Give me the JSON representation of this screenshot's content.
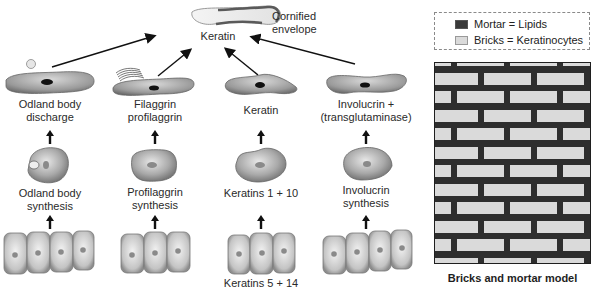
{
  "top": {
    "envelope_label_line1": "Cornified",
    "envelope_label_line2": "envelope",
    "keratin_label": "Keratin"
  },
  "columns": [
    {
      "stage3": [
        "Odland body",
        "discharge"
      ],
      "stage2": [
        "Odland body",
        "synthesis"
      ],
      "stage1": []
    },
    {
      "stage3": [
        "Filaggrin",
        "profilaggrin"
      ],
      "stage2": [
        "Profilaggrin",
        "synthesis"
      ],
      "stage1": []
    },
    {
      "stage3": [
        "Keratin"
      ],
      "stage2": [
        "Keratins 1 + 10"
      ],
      "stage1": [
        "Keratins 5 + 14"
      ]
    },
    {
      "stage3": [
        "Involucrin +",
        "(transglutaminase)"
      ],
      "stage2": [
        "Involucrin",
        "synthesis"
      ],
      "stage1": []
    }
  ],
  "legend": {
    "items": [
      {
        "label": "Mortar = Lipids",
        "color": "#3a3a3a"
      },
      {
        "label": "Bricks = Keratinocytes",
        "color": "#dadada"
      }
    ]
  },
  "model": {
    "caption": "Bricks and mortar model",
    "mortar_color": "#2e2e2e",
    "brick_color": "#dadada",
    "rows": 12
  }
}
